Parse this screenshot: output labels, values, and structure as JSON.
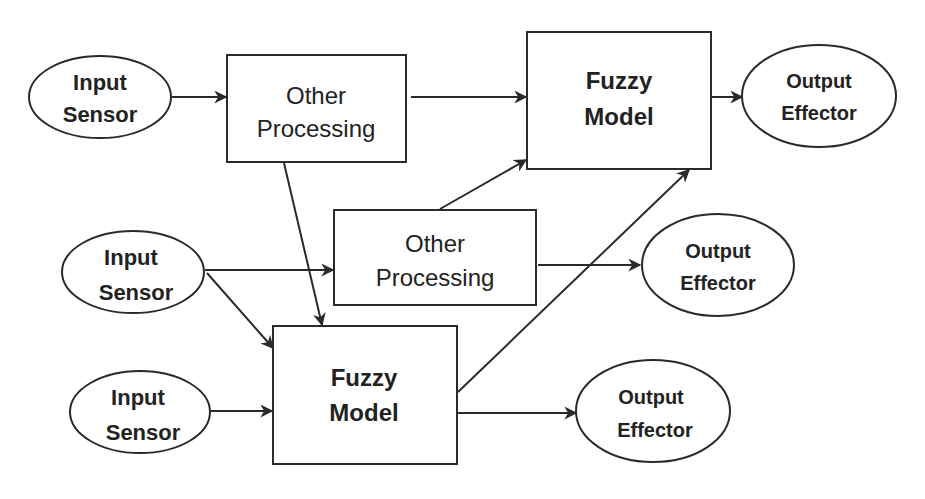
{
  "diagram": {
    "type": "block-flow",
    "colors": {
      "stroke": "#2a2a2a",
      "text": "#222222",
      "background": "#ffffff"
    },
    "nodes": [
      {
        "id": "input1",
        "shape": "ellipse",
        "line1": "Input",
        "line2": "Sensor"
      },
      {
        "id": "other1",
        "shape": "rect",
        "line1": "Other",
        "line2": "Processing"
      },
      {
        "id": "fuzzy1",
        "shape": "rect",
        "line1": "Fuzzy",
        "line2": "Model"
      },
      {
        "id": "output1",
        "shape": "ellipse",
        "line1": "Output",
        "line2": "Effector"
      },
      {
        "id": "input2",
        "shape": "ellipse",
        "line1": "Input",
        "line2": "Sensor"
      },
      {
        "id": "other2",
        "shape": "rect",
        "line1": "Other",
        "line2": "Processing"
      },
      {
        "id": "output2",
        "shape": "ellipse",
        "line1": "Output",
        "line2": "Effector"
      },
      {
        "id": "input3",
        "shape": "ellipse",
        "line1": "Input",
        "line2": "Sensor"
      },
      {
        "id": "fuzzy2",
        "shape": "rect",
        "line1": "Fuzzy",
        "line2": "Model"
      },
      {
        "id": "output3",
        "shape": "ellipse",
        "line1": "Output",
        "line2": "Effector"
      }
    ],
    "edges": [
      {
        "from": "input1",
        "to": "other1"
      },
      {
        "from": "other1",
        "to": "fuzzy1"
      },
      {
        "from": "fuzzy1",
        "to": "output1"
      },
      {
        "from": "other1",
        "to": "fuzzy2"
      },
      {
        "from": "other2",
        "to": "fuzzy1"
      },
      {
        "from": "fuzzy2",
        "to": "fuzzy1"
      },
      {
        "from": "input2",
        "to": "other2"
      },
      {
        "from": "input2",
        "to": "fuzzy2"
      },
      {
        "from": "other2",
        "to": "output2"
      },
      {
        "from": "input3",
        "to": "fuzzy2"
      },
      {
        "from": "fuzzy2",
        "to": "output3"
      }
    ]
  }
}
